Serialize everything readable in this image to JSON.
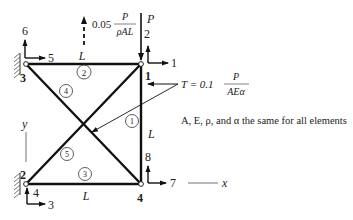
{
  "diagram": {
    "type": "plane truss",
    "nodes": [
      {
        "id": "1",
        "dofs": [
          "1",
          "2"
        ]
      },
      {
        "id": "2",
        "dofs": [
          "3",
          "4"
        ]
      },
      {
        "id": "3",
        "dofs": [
          "5",
          "6"
        ]
      },
      {
        "id": "4",
        "dofs": [
          "7",
          "8"
        ]
      }
    ],
    "elements": [
      {
        "id": "1",
        "connects": [
          "1",
          "4"
        ]
      },
      {
        "id": "2",
        "connects": [
          "3",
          "1"
        ]
      },
      {
        "id": "3",
        "connects": [
          "2",
          "4"
        ]
      },
      {
        "id": "4",
        "connects": [
          "3",
          "4"
        ]
      },
      {
        "id": "5",
        "connects": [
          "2",
          "1"
        ]
      }
    ],
    "length_labels": {
      "top": "L",
      "bottom": "L",
      "right": "L"
    },
    "loads": {
      "point_load_label": "P",
      "body_force_coef": "0.05",
      "body_force_num": "P",
      "body_force_den": "ρAL",
      "temp_prefix": "T = 0.1",
      "temp_num": "P",
      "temp_den": "AEα"
    },
    "axes": {
      "x": "x",
      "y": "y"
    },
    "note": "A, E, ρ, and α the same for all elements"
  }
}
